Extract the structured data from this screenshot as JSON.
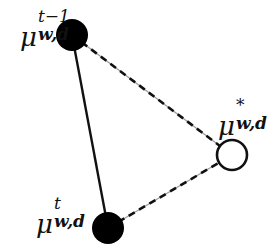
{
  "diagram": {
    "nodes": [
      {
        "id": "mu_prev",
        "symbol": "μ",
        "superscript": "t−1",
        "subscript": "w,d",
        "fill": "#000000",
        "style": "filled",
        "cx": 72,
        "cy": 35,
        "r": 16
      },
      {
        "id": "mu_star",
        "symbol": "μ",
        "superscript": "*",
        "subscript": "w,d",
        "fill": "#ffffff",
        "style": "open",
        "cx": 232,
        "cy": 155,
        "r": 15
      },
      {
        "id": "mu_cur",
        "symbol": "μ",
        "superscript": "t",
        "subscript": "w,d",
        "fill": "#000000",
        "style": "filled",
        "cx": 108,
        "cy": 228,
        "r": 16
      }
    ],
    "edges": [
      {
        "from": "mu_prev",
        "to": "mu_cur",
        "style": "solid"
      },
      {
        "from": "mu_prev",
        "to": "mu_star",
        "style": "dashed"
      },
      {
        "from": "mu_cur",
        "to": "mu_star",
        "style": "dashed"
      }
    ],
    "colors": {
      "stroke": "#111111",
      "dash_base": "#9a9a9a",
      "background": "#ffffff"
    }
  }
}
